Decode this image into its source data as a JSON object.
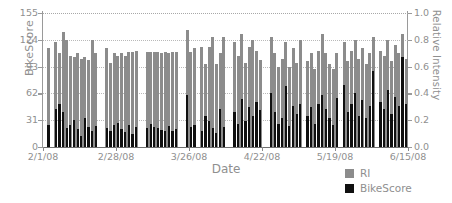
{
  "chart_data": {
    "type": "bar",
    "title": "",
    "xlabel": "Date",
    "ylabel": "BikeScore",
    "ylabel_right": "Relative Intensity",
    "ylim": [
      0,
      155
    ],
    "ylim_right": [
      0.0,
      1.0
    ],
    "yticks": [
      0,
      31,
      62,
      93,
      124,
      155
    ],
    "yticks_right": [
      "0.0",
      "0.2",
      "0.4",
      "0.6",
      "0.8",
      "1.0"
    ],
    "xtick_labels": [
      "2/1/08",
      "2/28/08",
      "3/26/08",
      "4/22/08",
      "5/19/08",
      "6/15/08"
    ],
    "grid": true,
    "legend_position": "bottom-right",
    "series": [
      {
        "name": "RI",
        "color": "#8c8c8c",
        "axis": "right",
        "values": [
          0.0,
          0.74,
          0.0,
          0.78,
          0.7,
          0.86,
          0.8,
          0.68,
          0.67,
          0.7,
          0.66,
          0.67,
          0.65,
          0.8,
          0.7,
          0.0,
          0.0,
          0.74,
          0.63,
          0.7,
          0.68,
          0.7,
          0.68,
          0.71,
          0.71,
          0.72,
          0.0,
          0.0,
          0.71,
          0.71,
          0.71,
          0.71,
          0.7,
          0.71,
          0.7,
          0.71,
          0.71,
          0.0,
          0.0,
          0.87,
          0.71,
          0.74,
          0.0,
          0.75,
          0.62,
          0.75,
          0.82,
          0.62,
          0.7,
          0.82,
          0.0,
          0.0,
          0.78,
          0.68,
          0.84,
          0.63,
          0.75,
          0.8,
          0.72,
          0.65,
          0.0,
          0.0,
          0.82,
          0.7,
          0.6,
          0.66,
          0.78,
          0.6,
          0.74,
          0.63,
          0.8,
          0.0,
          0.64,
          0.7,
          0.58,
          0.72,
          0.84,
          0.7,
          0.62,
          0.58,
          0.7,
          0.0,
          0.78,
          0.64,
          0.72,
          0.8,
          0.66,
          0.74,
          0.62,
          0.7,
          0.82,
          0.0,
          0.72,
          0.68,
          0.8,
          0.64,
          0.76,
          0.7,
          0.84,
          0.66
        ]
      },
      {
        "name": "BikeScore",
        "color": "#101010",
        "axis": "left",
        "values": [
          0,
          26,
          0,
          44,
          50,
          41,
          22,
          26,
          31,
          21,
          13,
          34,
          23,
          19,
          24,
          0,
          0,
          22,
          19,
          26,
          28,
          21,
          17,
          26,
          15,
          23,
          0,
          0,
          22,
          27,
          23,
          22,
          20,
          18,
          24,
          19,
          21,
          0,
          0,
          60,
          23,
          25,
          0,
          18,
          36,
          30,
          22,
          16,
          44,
          23,
          0,
          0,
          40,
          27,
          55,
          30,
          46,
          36,
          52,
          43,
          0,
          0,
          62,
          40,
          27,
          33,
          71,
          24,
          48,
          38,
          50,
          0,
          36,
          46,
          27,
          50,
          60,
          44,
          33,
          26,
          57,
          0,
          72,
          41,
          50,
          62,
          36,
          54,
          33,
          47,
          88,
          0,
          52,
          44,
          66,
          38,
          58,
          48,
          104,
          50
        ]
      }
    ]
  },
  "legend": {
    "items": [
      {
        "label": "RI",
        "color": "#8c8c8c"
      },
      {
        "label": "BikeScore",
        "color": "#101010"
      }
    ]
  }
}
